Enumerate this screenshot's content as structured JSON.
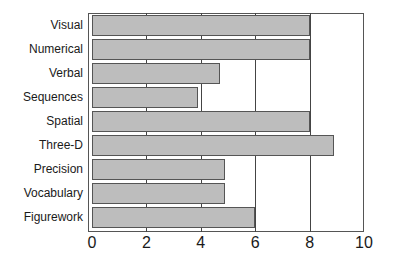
{
  "chart_data": {
    "type": "bar",
    "orientation": "horizontal",
    "title": "",
    "xlabel": "",
    "ylabel": "",
    "categories": [
      "Visual",
      "Numerical",
      "Verbal",
      "Sequences",
      "Spatial",
      "Three-D",
      "Precision",
      "Vocabulary",
      "Figurework"
    ],
    "values": [
      8,
      8,
      4.7,
      3.9,
      8,
      8.9,
      4.9,
      4.9,
      6
    ],
    "xlim": [
      0,
      10
    ],
    "xticks": [
      "0",
      "2",
      "4",
      "6",
      "8",
      "10"
    ],
    "grid": "vertical lines at 2,4,6,8",
    "legend": null,
    "colors": {
      "bar_fill": "#bdbdbd",
      "bar_edge": "#555555",
      "grid": "#444444"
    }
  }
}
